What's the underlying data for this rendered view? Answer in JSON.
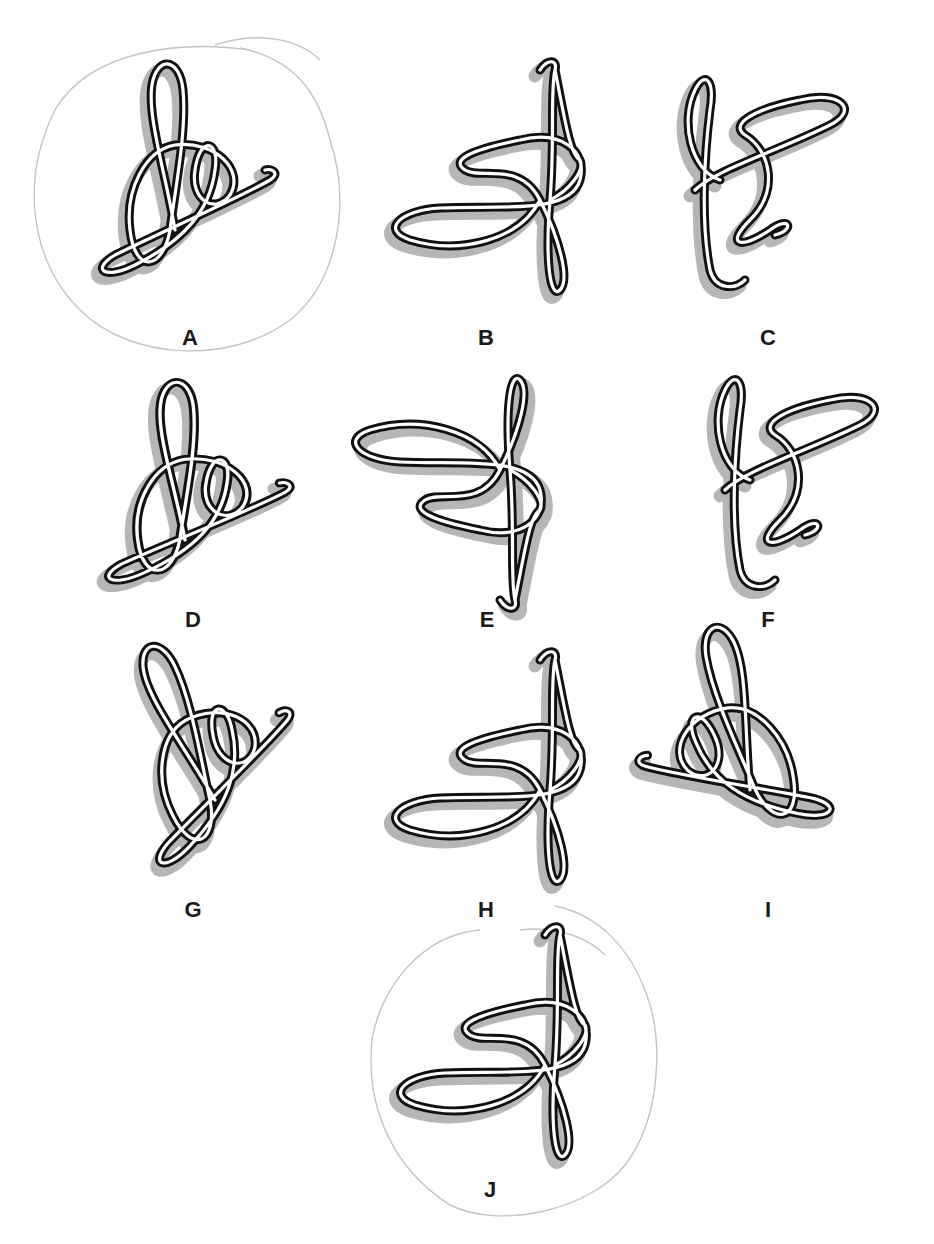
{
  "page": {
    "type": "figure-matching puzzle",
    "background": "#ffffff"
  },
  "figures": [
    {
      "id": "A",
      "label": "A",
      "circled": true,
      "label_pos": [
        190,
        338
      ]
    },
    {
      "id": "B",
      "label": "B",
      "circled": false,
      "label_pos": [
        486,
        338
      ]
    },
    {
      "id": "C",
      "label": "C",
      "circled": false,
      "label_pos": [
        768,
        338
      ]
    },
    {
      "id": "D",
      "label": "D",
      "circled": false,
      "label_pos": [
        193,
        620
      ]
    },
    {
      "id": "E",
      "label": "E",
      "circled": false,
      "label_pos": [
        487,
        620
      ]
    },
    {
      "id": "F",
      "label": "F",
      "circled": false,
      "label_pos": [
        768,
        620
      ]
    },
    {
      "id": "G",
      "label": "G",
      "circled": false,
      "label_pos": [
        193,
        910
      ]
    },
    {
      "id": "H",
      "label": "H",
      "circled": false,
      "label_pos": [
        486,
        910
      ]
    },
    {
      "id": "I",
      "label": "I",
      "circled": false,
      "label_pos": [
        768,
        910
      ]
    },
    {
      "id": "J",
      "label": "J",
      "circled": true,
      "label_pos": [
        490,
        1190
      ]
    }
  ],
  "annotations": {
    "circled_answers": [
      "A",
      "J"
    ],
    "circle_stroke_color": "#c4c4c4"
  },
  "style": {
    "rope_outline_color": "#111111",
    "rope_center_color": "#ffffff",
    "shadow_color": "#9d9d9d",
    "label_color": "#1a1a1a"
  }
}
